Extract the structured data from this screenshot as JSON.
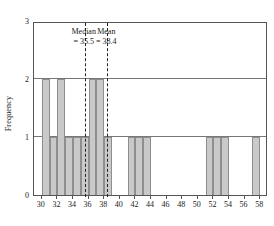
{
  "chart_data": {
    "type": "bar",
    "title": "",
    "xlabel": "",
    "ylabel": "Frequency",
    "xlim": [
      29,
      59
    ],
    "ylim": [
      0,
      3
    ],
    "xticks": [
      30,
      32,
      34,
      36,
      38,
      40,
      42,
      44,
      46,
      48,
      50,
      52,
      54,
      56,
      58
    ],
    "yticks": [
      0,
      1,
      2,
      3
    ],
    "grid": true,
    "bin_width": 1,
    "categories": [
      30,
      31,
      32,
      33,
      34,
      35,
      36,
      37,
      38,
      41,
      42,
      43,
      51,
      52,
      53,
      57
    ],
    "values": [
      2,
      1,
      2,
      1,
      1,
      1,
      2,
      2,
      1,
      1,
      1,
      1,
      1,
      1,
      1,
      1
    ],
    "annotations": [
      {
        "name": "median",
        "label_line1": "Median",
        "label_line2": "= 35.5",
        "value": 35.5
      },
      {
        "name": "mean",
        "label_line1": "Mean",
        "label_line2": "= 38.4",
        "value": 38.4
      }
    ],
    "bar_color": "#c9c9c9",
    "bar_edge_color": "#8e8e8e",
    "refline_color": "#222222",
    "axis_color": "#555555"
  }
}
